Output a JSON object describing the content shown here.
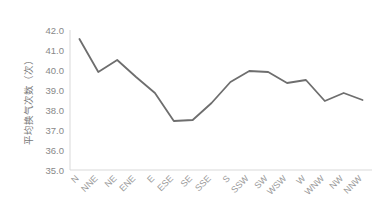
{
  "chart_data": {
    "type": "line",
    "title": "",
    "xlabel": "",
    "ylabel": "平均换气次数（次）",
    "categories": [
      "N",
      "NNE",
      "NE",
      "ENE",
      "E",
      "ESE",
      "SE",
      "SSE",
      "S",
      "SSW",
      "SW",
      "WSW",
      "W",
      "WNW",
      "NW",
      "NNW"
    ],
    "values": [
      41.55,
      39.9,
      40.5,
      39.65,
      38.85,
      37.45,
      37.5,
      38.35,
      39.4,
      39.95,
      39.9,
      39.35,
      39.5,
      38.45,
      38.85,
      38.5
    ],
    "ylim": [
      35.0,
      42.0
    ],
    "ytick_labels": [
      "42.0",
      "41.0",
      "40.0",
      "39.0",
      "38.0",
      "37.0",
      "36.0",
      "35.0"
    ],
    "ytick_values": [
      42.0,
      41.0,
      40.0,
      39.0,
      38.0,
      37.0,
      36.0,
      35.0
    ],
    "grid": false,
    "legend": null,
    "legend_position": "none",
    "series_color": "#6E6E6E",
    "axis_color": "#D9D9D9",
    "tick_text_color": "#8C8C8C",
    "background_color": "#FFFFFF"
  },
  "axis": {
    "y_title": "平均换气次数（次）"
  }
}
